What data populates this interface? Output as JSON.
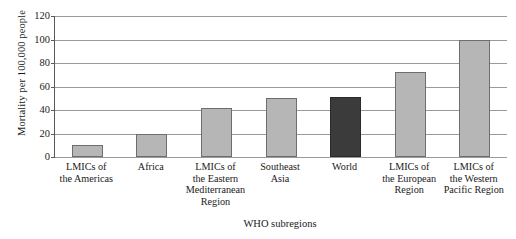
{
  "chart_data": {
    "type": "bar",
    "title": "",
    "xlabel": "WHO subregions",
    "ylabel": "Mortality per 100,000 people",
    "categories": [
      "LMICs of\nthe Americas",
      "Africa",
      "LMICs of\nthe Eastern\nMediterranean\nRegion",
      "Southeast\nAsia",
      "World",
      "LMICs of\nthe European\nRegion",
      "LMICs of\nthe Western\nPacific Region"
    ],
    "values": [
      10,
      20,
      42,
      50,
      51,
      72,
      100
    ],
    "ylim": [
      0,
      120
    ],
    "yticks": [
      0,
      20,
      40,
      60,
      80,
      100,
      120
    ],
    "ytick_labels": [
      "0",
      "20",
      "40",
      "60",
      "80",
      "100",
      "120"
    ],
    "grid": "horizontal",
    "legend": "none",
    "bar_colors": [
      "#b6b6b6",
      "#b6b6b6",
      "#b6b6b6",
      "#b6b6b6",
      "#3b3b3b",
      "#b6b6b6",
      "#b6b6b6"
    ],
    "highlight_category": "World",
    "colors": {
      "bar_fill": "#b6b6b6",
      "bar_edge": "#6e6e6e",
      "highlight_fill": "#3b3b3b",
      "highlight_edge": "#2a2a2a",
      "gridline": "#9a9a9a",
      "axis": "#5a5a5a",
      "text": "#1a1a1a",
      "background": "#ffffff"
    }
  }
}
